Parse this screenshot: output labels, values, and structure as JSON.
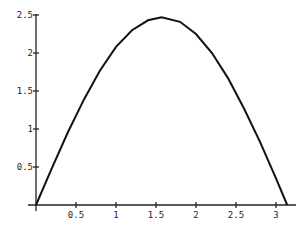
{
  "chart_data": {
    "type": "line",
    "title": "",
    "xlabel": "",
    "ylabel": "",
    "xlim": [
      0,
      3.2
    ],
    "ylim": [
      0,
      2.5
    ],
    "grid": false,
    "legend": null,
    "x_ticks": [
      "0.5",
      "1",
      "1.5",
      "2",
      "2.5",
      "3"
    ],
    "y_ticks": [
      "0.5",
      "1",
      "1.5",
      "2",
      "2.5"
    ],
    "series": [
      {
        "name": "curve",
        "x": [
          0,
          0.2,
          0.4,
          0.6,
          0.8,
          1.0,
          1.2,
          1.4,
          1.57,
          1.8,
          2.0,
          2.2,
          2.4,
          2.6,
          2.8,
          3.0,
          3.14
        ],
        "values": [
          0,
          0.49,
          0.96,
          1.39,
          1.77,
          2.08,
          2.3,
          2.43,
          2.47,
          2.41,
          2.25,
          2.0,
          1.67,
          1.27,
          0.83,
          0.35,
          0
        ]
      }
    ]
  }
}
